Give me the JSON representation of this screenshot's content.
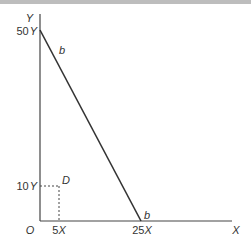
{
  "diagram": {
    "axes": {
      "y_label": "Y",
      "x_label": "X",
      "origin_label": "O"
    },
    "ticks": {
      "y": [
        {
          "label": "50",
          "unit": "Y"
        },
        {
          "label": "10",
          "unit": "Y"
        }
      ],
      "x": [
        {
          "label": "5",
          "unit": "X"
        },
        {
          "label": "25",
          "unit": "X"
        }
      ]
    },
    "line": {
      "label_top": "b",
      "label_bottom": "b",
      "from": "50Y",
      "to": "25X"
    },
    "point": {
      "label": "D",
      "x": "5X",
      "y": "10Y"
    }
  }
}
